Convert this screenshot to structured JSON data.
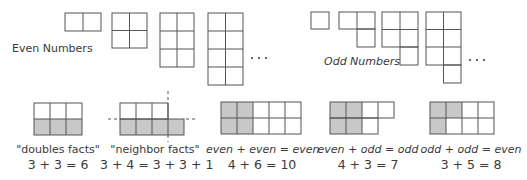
{
  "even_section": {
    "label": "Even Numbers",
    "figures": [
      {
        "value": 2,
        "columns": 2,
        "rows": 1
      },
      {
        "value": 4,
        "columns": 2,
        "rows": 2
      },
      {
        "value": 6,
        "columns": 2,
        "rows": 3
      },
      {
        "value": 8,
        "columns": 2,
        "rows": 4
      }
    ],
    "continuation": "• • •"
  },
  "odd_section": {
    "label": "Odd Numbers",
    "figures": [
      {
        "value": 1
      },
      {
        "value": 3
      },
      {
        "value": 5
      },
      {
        "value": 7
      }
    ],
    "continuation": "• • •"
  },
  "facts": [
    {
      "id": "doubles",
      "title": "\"doubles facts\"",
      "equation": "3 + 3 = 6",
      "top_row_cells": 3,
      "bottom_row_cells": 3,
      "shaded": "bottom row"
    },
    {
      "id": "neighbor",
      "title": "\"neighbor facts\"",
      "equation": "3 + 4 = 3 + 3 + 1",
      "top_row_cells": 3,
      "bottom_row_cells": 4,
      "shaded": "bottom row"
    },
    {
      "id": "even-even",
      "title": "even + even = even",
      "equation": "4 + 6 = 10",
      "top_row_cells": 5,
      "bottom_row_cells": 5,
      "shaded_columns": 2
    },
    {
      "id": "even-odd",
      "title": "even + odd = odd",
      "equation": "4 + 3 = 7",
      "top_row_cells": 4,
      "bottom_row_cells": 3,
      "shaded_columns": 2
    },
    {
      "id": "odd-odd",
      "title": "odd + odd = even",
      "equation": "3 + 5 = 8",
      "top_row_cells": 4,
      "bottom_row_cells": 4,
      "shaded_cells": 3
    }
  ],
  "colors": {
    "line": "#555555",
    "shade": "#c8c8c8",
    "text": "#3a3a3a"
  }
}
